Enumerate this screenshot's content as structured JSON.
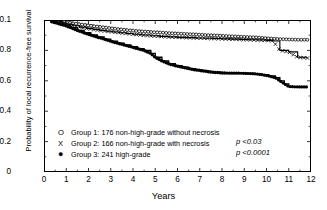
{
  "chart_data": {
    "type": "line",
    "title": "",
    "xlabel": "Years",
    "ylabel": "Probability of local recurrence-free survival",
    "xlim": [
      0,
      12
    ],
    "ylim": [
      0,
      1.0
    ],
    "xticks": [
      "0",
      "1",
      "2",
      "3",
      "4",
      "5",
      "6",
      "7",
      "8",
      "9",
      "10",
      "11",
      "12"
    ],
    "yticks": [
      "0",
      "0.2",
      "0.4",
      "0.6",
      "0.8",
      "0.1"
    ],
    "grid": false,
    "legend_position": "lower-left",
    "annotations": [
      "p <0.03",
      "p <0.0001"
    ],
    "series": [
      {
        "name": "Group 1: 176 non-high-grade without necrosis",
        "marker": "O",
        "marker_name": "open-circle",
        "group_number": 1,
        "n": 176,
        "description": "non-high-grade without necrosis",
        "x": [
          0,
          0.35,
          0.7,
          1.0,
          1.3,
          1.6,
          1.9,
          2.2,
          2.5,
          2.8,
          3.1,
          3.4,
          3.7,
          4.0,
          4.4,
          4.8,
          5.2,
          5.6,
          6.0,
          6.4,
          6.8,
          7.2,
          7.6,
          8.0,
          8.4,
          8.8,
          9.2,
          9.6,
          10.0,
          10.5,
          11.0,
          11.5,
          11.9
        ],
        "y": [
          1.0,
          0.995,
          0.99,
          0.985,
          0.978,
          0.972,
          0.966,
          0.96,
          0.955,
          0.95,
          0.944,
          0.939,
          0.934,
          0.93,
          0.925,
          0.921,
          0.918,
          0.914,
          0.911,
          0.908,
          0.905,
          0.902,
          0.899,
          0.896,
          0.893,
          0.89,
          0.888,
          0.885,
          0.88,
          0.875,
          0.872,
          0.87,
          0.87
        ]
      },
      {
        "name": "Group 2: 166 non-high-grade with necrosis",
        "marker": "X",
        "marker_name": "cross",
        "group_number": 2,
        "n": 166,
        "description": "non-high-grade with necrosis",
        "x": [
          0,
          0.35,
          0.7,
          1.0,
          1.3,
          1.6,
          1.9,
          2.2,
          2.5,
          2.8,
          3.1,
          3.4,
          3.7,
          4.0,
          4.4,
          4.8,
          5.2,
          5.6,
          6.0,
          6.4,
          6.8,
          7.2,
          7.6,
          8.0,
          8.4,
          8.8,
          9.2,
          9.6,
          10.0,
          10.3,
          10.6,
          11.0,
          11.4,
          11.8
        ],
        "y": [
          1.0,
          0.992,
          0.982,
          0.972,
          0.962,
          0.953,
          0.945,
          0.938,
          0.932,
          0.926,
          0.921,
          0.916,
          0.911,
          0.906,
          0.901,
          0.896,
          0.892,
          0.889,
          0.886,
          0.884,
          0.882,
          0.88,
          0.878,
          0.876,
          0.874,
          0.872,
          0.87,
          0.868,
          0.866,
          0.862,
          0.8,
          0.79,
          0.755,
          0.75
        ]
      },
      {
        "name": "Group 3: 241 high-grade",
        "marker": "●",
        "marker_name": "filled-circle",
        "group_number": 3,
        "n": 241,
        "description": "high-grade",
        "x": [
          0,
          0.3,
          0.6,
          0.9,
          1.2,
          1.5,
          1.8,
          2.1,
          2.4,
          2.7,
          3.0,
          3.3,
          3.6,
          3.9,
          4.2,
          4.5,
          4.8,
          5.0,
          5.3,
          5.6,
          5.9,
          6.2,
          6.5,
          6.8,
          7.1,
          7.4,
          7.7,
          8.0,
          8.4,
          8.8,
          9.2,
          9.5,
          9.8,
          10.1,
          10.4,
          10.6,
          10.8,
          11.0,
          11.4,
          11.8
        ],
        "y": [
          1.0,
          0.99,
          0.978,
          0.966,
          0.95,
          0.932,
          0.916,
          0.902,
          0.888,
          0.874,
          0.86,
          0.848,
          0.836,
          0.824,
          0.812,
          0.8,
          0.78,
          0.755,
          0.73,
          0.712,
          0.7,
          0.69,
          0.68,
          0.672,
          0.666,
          0.66,
          0.655,
          0.652,
          0.65,
          0.65,
          0.648,
          0.646,
          0.64,
          0.632,
          0.62,
          0.6,
          0.58,
          0.562,
          0.56,
          0.56
        ]
      }
    ]
  },
  "legend": {
    "items": [
      {
        "marker": "O",
        "label": "Group 1: 176 non-high-grade without necrosis"
      },
      {
        "marker": "X",
        "label": "Group 2: 166 non-high-grade with necrosis"
      },
      {
        "marker": "●",
        "label": "Group 3: 241 high-grade"
      }
    ]
  },
  "pvalues": {
    "first": "p <0.03",
    "second": "p <0.0001"
  },
  "axes": {
    "xlabel": "Years",
    "ylabel": "Probability of local recurrence-free survival",
    "xticks": [
      "0",
      "1",
      "2",
      "3",
      "4",
      "5",
      "6",
      "7",
      "8",
      "9",
      "10",
      "11",
      "12"
    ],
    "yticks": [
      {
        "value": 1.0,
        "label": "0.1"
      },
      {
        "value": 0.8,
        "label": "0.8"
      },
      {
        "value": 0.6,
        "label": "0.6"
      },
      {
        "value": 0.4,
        "label": "0.4"
      },
      {
        "value": 0.2,
        "label": "0.2"
      },
      {
        "value": 0.0,
        "label": "0"
      }
    ]
  },
  "colors": {
    "line": "#000000",
    "background": "#ffffff"
  }
}
